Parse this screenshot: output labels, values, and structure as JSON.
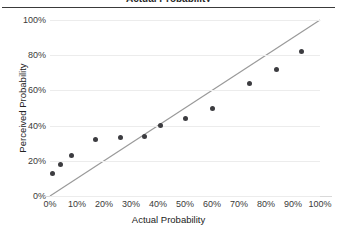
{
  "chart_data": {
    "type": "scatter",
    "title": "Actual Probability",
    "xlabel": "Actual Probability",
    "ylabel": "Perceived Probability",
    "xlim": [
      0,
      100
    ],
    "ylim": [
      0,
      100
    ],
    "grid": true,
    "legend": "none",
    "x_ticks": [
      "0%",
      "10%",
      "20%",
      "30%",
      "40%",
      "50%",
      "60%",
      "70%",
      "80%",
      "90%",
      "100%"
    ],
    "x_tick_values": [
      0,
      10,
      20,
      30,
      40,
      50,
      60,
      70,
      80,
      90,
      100
    ],
    "y_ticks": [
      "0%",
      "20%",
      "40%",
      "60%",
      "80%",
      "100%"
    ],
    "y_tick_values": [
      0,
      20,
      40,
      60,
      80,
      100
    ],
    "series": [
      {
        "name": "Perceived vs Actual",
        "marker": "circle",
        "color": "#3c3c40",
        "points": [
          {
            "x": 1,
            "y": 13
          },
          {
            "x": 4,
            "y": 18
          },
          {
            "x": 8,
            "y": 23
          },
          {
            "x": 17,
            "y": 32
          },
          {
            "x": 26,
            "y": 33
          },
          {
            "x": 35,
            "y": 34
          },
          {
            "x": 41,
            "y": 40
          },
          {
            "x": 50,
            "y": 44
          },
          {
            "x": 60,
            "y": 50
          },
          {
            "x": 74,
            "y": 64
          },
          {
            "x": 84,
            "y": 72
          },
          {
            "x": 93,
            "y": 82
          }
        ]
      }
    ],
    "reference_line": {
      "name": "identity-line",
      "color": "#9a9a9a",
      "from": {
        "x": 0,
        "y": 0
      },
      "to": {
        "x": 100,
        "y": 100
      }
    }
  },
  "colors": {
    "marker": "#3c3c40",
    "reference_line": "#9a9a9a",
    "gridline": "#ececec",
    "axis": "#d9d9d9",
    "text": "#3a3a3a",
    "title_rule": "#3a3a3a"
  }
}
